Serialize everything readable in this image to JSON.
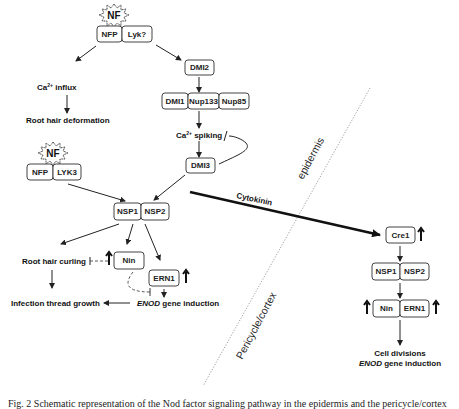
{
  "figure": {
    "signals": {
      "nf_top": "NF",
      "nf_left": "NF"
    },
    "epidermis_pathway": {
      "receptor_top": [
        "NFP",
        "Lyk?"
      ],
      "ca_influx": "Ca²⁺ influx",
      "ca_influx_base": "Ca",
      "ca_influx_sup": "2+",
      "ca_influx_rest": " influx",
      "root_hair_deformation": "Root hair deformation",
      "dmi2": "DMI2",
      "nuclear_pore": [
        "DMI1",
        "Nup133",
        "Nup85"
      ],
      "ca_spiking_base": "Ca",
      "ca_spiking_sup": "2+",
      "ca_spiking_rest": " spiking",
      "dmi3": "DMI3",
      "receptor_left": [
        "NFP",
        "LYK3"
      ],
      "nsp": [
        "NSP1",
        "NSP2"
      ],
      "nin": "Nin",
      "ern1": "ERN1",
      "root_hair_curling": "Root hair curling",
      "infection_thread_growth": "Infection thread growth",
      "enod_italic": "ENOD",
      "enod_rest": " gene induction"
    },
    "cytokinin_label": "Cytokinin",
    "regions": {
      "epidermis": "epidermis",
      "pericycle_cortex": "Pericycle/cortex"
    },
    "cortex_pathway": {
      "cre1": "Cre1",
      "nsp": [
        "NSP1",
        "NSP2"
      ],
      "nin": "Nin",
      "ern1": "ERN1",
      "outcome_line1": "Cell divisions",
      "outcome_italic": "ENOD",
      "outcome_line2_rest": " gene induction"
    },
    "caption": "Fig. 2  Schematic representation of the Nod factor signaling pathway in the epidermis and the pericycle/cortex"
  }
}
